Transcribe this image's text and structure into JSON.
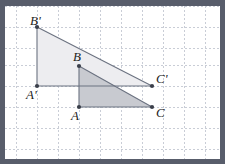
{
  "figure": {
    "background_color": "#ffffff",
    "frame_color": "#585d6b",
    "grid": {
      "spacing": 21,
      "origin_x": 11,
      "origin_y": 0,
      "color": "#c9cdd6",
      "style": "dashed",
      "visible": true
    },
    "stroke_color": "#6b7280",
    "vertex_marker_color": "#3a3f4a",
    "large_triangle": {
      "name": "triangle-a-prime-b-prime-c-prime",
      "fill": "#ededf0",
      "vertices": [
        {
          "label": "B'",
          "x": 32,
          "y": 21
        },
        {
          "label": "A'",
          "x": 32,
          "y": 80
        },
        {
          "label": "C'",
          "x": 147,
          "y": 80
        }
      ]
    },
    "small_triangle": {
      "name": "triangle-abc",
      "fill": "#c8cad0",
      "vertices": [
        {
          "label": "B",
          "x": 74,
          "y": 60
        },
        {
          "label": "A",
          "x": 74,
          "y": 101
        },
        {
          "label": "C",
          "x": 147,
          "y": 101
        }
      ]
    },
    "labels": [
      {
        "id": "label-b-prime",
        "text": "B'",
        "x": 25,
        "y": 8,
        "anchor": "vertex-b-prime"
      },
      {
        "id": "label-a-prime",
        "text": "A'",
        "x": 21,
        "y": 82,
        "anchor": "vertex-a-prime"
      },
      {
        "id": "label-c-prime",
        "text": "C'",
        "x": 151,
        "y": 66,
        "anchor": "vertex-c-prime"
      },
      {
        "id": "label-b",
        "text": "B",
        "x": 68,
        "y": 44,
        "anchor": "vertex-b"
      },
      {
        "id": "label-a",
        "text": "A",
        "x": 66,
        "y": 103,
        "anchor": "vertex-a"
      },
      {
        "id": "label-c",
        "text": "C",
        "x": 151,
        "y": 100,
        "anchor": "vertex-c"
      }
    ]
  }
}
